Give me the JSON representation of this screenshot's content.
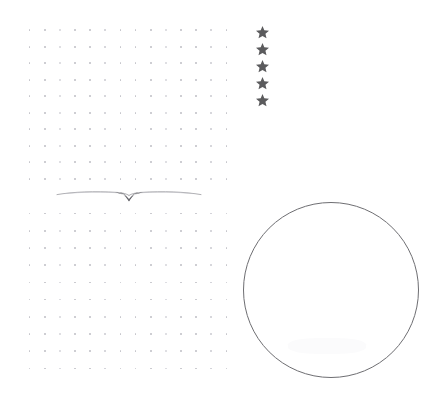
{
  "page": {
    "width": 439,
    "height": 406,
    "background_color": "#ffffff"
  },
  "dot_grid_top": {
    "name": "top dotted grid",
    "columns": 14,
    "rows": 10,
    "left": 22,
    "top": 22,
    "width": 212,
    "height": 165,
    "dot_color": "#c4c4ca",
    "dot_size_px": 1.6,
    "column_spacing_px": 15,
    "row_spacing_px": 18
  },
  "dot_grid_bottom": {
    "name": "bottom dotted grid",
    "columns": 14,
    "rows": 10,
    "left": 22,
    "top": 205,
    "width": 212,
    "height": 172,
    "dot_color": "#c4c4ca",
    "dot_size_px": 1.6,
    "column_spacing_px": 15,
    "row_spacing_px": 18
  },
  "star_rating": {
    "name": "five star column",
    "count": 5,
    "glyph": "star-icon",
    "symbol": "★",
    "color": "#5b5b5d",
    "left": 255,
    "top": 25,
    "size_px": 15,
    "spacing_px": 17,
    "items": [
      {
        "label": "star 1"
      },
      {
        "label": "star 2"
      },
      {
        "label": "star 3"
      },
      {
        "label": "star 4"
      },
      {
        "label": "star 5"
      }
    ]
  },
  "divider": {
    "name": "ornamental swash divider",
    "icon": "swash-divider-icon",
    "left": 55,
    "top": 183,
    "width": 148,
    "height": 22,
    "stroke_color": "#8d8d93",
    "accent_color": "#56565b"
  },
  "circle": {
    "name": "hand drawn circle outline",
    "left": 243,
    "top": 202,
    "diameter": 176,
    "stroke_color": "#6e6e72",
    "stroke_width": 1,
    "fill": "transparent",
    "center_x": 331,
    "center_y": 290
  },
  "smudge": {
    "name": "faint scan smudge",
    "left": 288,
    "top": 338,
    "width": 78,
    "height": 16,
    "color": "#fbfbfc"
  }
}
